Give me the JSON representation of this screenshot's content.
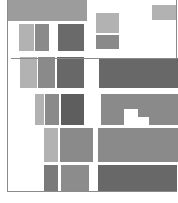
{
  "title": "",
  "palette": {
    "light": "#b2b2b2",
    "mid": "#8c8c8c",
    "dark": "#6a6a6a",
    "darker": "#5e5e5e",
    "frame": "#8a8a8a",
    "background": "#ffffff"
  },
  "frame_lines": [
    {
      "id": "left-frame-line",
      "x": 7,
      "y": 0,
      "w": 1,
      "h": 192
    },
    {
      "id": "bottom-frame-line",
      "x": 7,
      "y": 191,
      "w": 170,
      "h": 1
    },
    {
      "id": "right-top-frame-line",
      "x": 176,
      "y": 0,
      "w": 1,
      "h": 58
    },
    {
      "id": "upper-divider-line",
      "x": 11,
      "y": 58,
      "w": 166,
      "h": 1
    }
  ],
  "blocks": [
    {
      "id": "top-banner-block",
      "x": 7,
      "y": 0,
      "w": 80,
      "h": 21,
      "color": "#9c9c9c"
    },
    {
      "id": "top-right-small-block",
      "x": 152,
      "y": 5,
      "w": 24,
      "h": 15,
      "color": "#b2b2b2"
    },
    {
      "id": "row1-light-block",
      "x": 19,
      "y": 24,
      "w": 15,
      "h": 27,
      "color": "#b2b2b2"
    },
    {
      "id": "row1-mid-block",
      "x": 35,
      "y": 24,
      "w": 14,
      "h": 27,
      "color": "#8a8a8a"
    },
    {
      "id": "row1-dark-block",
      "x": 58,
      "y": 24,
      "w": 26,
      "h": 27,
      "color": "#6a6a6a"
    },
    {
      "id": "row1-right-light-block",
      "x": 96,
      "y": 13,
      "w": 23,
      "h": 20,
      "color": "#b2b2b2"
    },
    {
      "id": "row1-right-mid-block",
      "x": 96,
      "y": 35,
      "w": 23,
      "h": 14,
      "color": "#8a8a8a"
    },
    {
      "id": "row2-light-block",
      "x": 20,
      "y": 57,
      "w": 17,
      "h": 31,
      "color": "#b2b2b2"
    },
    {
      "id": "row2-mid-block",
      "x": 38,
      "y": 57,
      "w": 17,
      "h": 31,
      "color": "#8a8a8a"
    },
    {
      "id": "row2-dark-block",
      "x": 57,
      "y": 57,
      "w": 27,
      "h": 31,
      "color": "#686868"
    },
    {
      "id": "row2-right-wide-block",
      "x": 99,
      "y": 58,
      "w": 79,
      "h": 30,
      "color": "#686868"
    },
    {
      "id": "row3-light-block",
      "x": 35,
      "y": 94,
      "w": 9,
      "h": 31,
      "color": "#b2b2b2"
    },
    {
      "id": "row3-mid-block",
      "x": 45,
      "y": 94,
      "w": 14,
      "h": 31,
      "color": "#8a8a8a"
    },
    {
      "id": "row3-dark-block",
      "x": 61,
      "y": 94,
      "w": 23,
      "h": 31,
      "color": "#5e5e5e"
    },
    {
      "id": "row3-right-block",
      "x": 101,
      "y": 94,
      "w": 77,
      "h": 31,
      "color": "#8a8a8a"
    },
    {
      "id": "row3-notch-upper",
      "x": 124,
      "y": 109,
      "w": 14,
      "h": 16,
      "color": "#ffffff"
    },
    {
      "id": "row3-notch-lower",
      "x": 138,
      "y": 117,
      "w": 11,
      "h": 8,
      "color": "#ffffff"
    },
    {
      "id": "row4-light-block",
      "x": 44,
      "y": 128,
      "w": 14,
      "h": 34,
      "color": "#b2b2b2"
    },
    {
      "id": "row4-mid-block",
      "x": 60,
      "y": 128,
      "w": 33,
      "h": 34,
      "color": "#8a8a8a"
    },
    {
      "id": "row4-right-block",
      "x": 98,
      "y": 128,
      "w": 80,
      "h": 34,
      "color": "#8a8a8a"
    },
    {
      "id": "row5-mid-dark-block",
      "x": 44,
      "y": 165,
      "w": 14,
      "h": 27,
      "color": "#7a7a7a"
    },
    {
      "id": "row5-mid-block",
      "x": 61,
      "y": 165,
      "w": 28,
      "h": 27,
      "color": "#8c8c8c"
    },
    {
      "id": "row5-right-dark-block",
      "x": 98,
      "y": 165,
      "w": 79,
      "h": 27,
      "color": "#686868"
    }
  ]
}
